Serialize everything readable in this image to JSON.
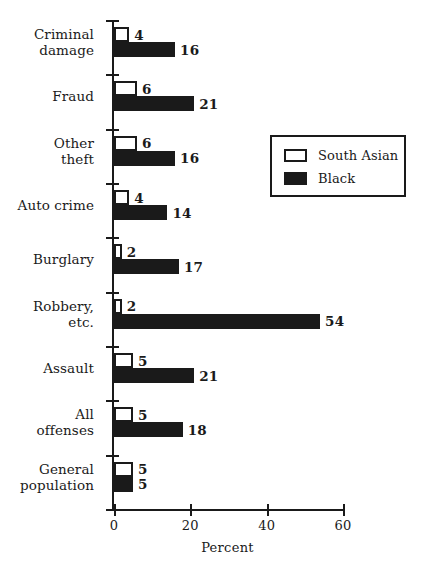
{
  "chart_data": {
    "type": "bar",
    "orientation": "horizontal",
    "title": "",
    "xlabel": "Percent",
    "ylabel": "",
    "xlim": [
      0,
      60
    ],
    "xticks": [
      0,
      20,
      40,
      60
    ],
    "xtick_labels": [
      "0",
      "20",
      "40",
      "60"
    ],
    "grid": false,
    "legend_position": "upper right",
    "categories": [
      "Criminal damage",
      "Fraud",
      "Other theft",
      "Auto crime",
      "Burglary",
      "Robbery, etc.",
      "Assault",
      "All offenses",
      "General population"
    ],
    "category_label_lines": [
      [
        "Criminal",
        "damage"
      ],
      [
        "Fraud"
      ],
      [
        "Other",
        "theft"
      ],
      [
        "Auto crime"
      ],
      [
        "Burglary"
      ],
      [
        "Robbery,",
        "etc."
      ],
      [
        "Assault"
      ],
      [
        "All",
        "offenses"
      ],
      [
        "General",
        "population"
      ]
    ],
    "series": [
      {
        "name": "South Asian",
        "style": "white-outlined",
        "color": "#ffffff",
        "edge_color": "#1a1a1a",
        "values": [
          4,
          6,
          6,
          4,
          2,
          2,
          5,
          5,
          5
        ],
        "value_labels": [
          "4",
          "6",
          "6",
          "4",
          "2",
          "2",
          "5",
          "5",
          "5"
        ]
      },
      {
        "name": "Black",
        "style": "solid-filled",
        "color": "#1a1a1a",
        "edge_color": "#1a1a1a",
        "values": [
          16,
          21,
          16,
          14,
          17,
          54,
          21,
          18,
          5
        ],
        "value_labels": [
          "16",
          "21",
          "16",
          "14",
          "17",
          "54",
          "21",
          "18",
          "5"
        ]
      }
    ]
  },
  "legend": {
    "entries": [
      {
        "label": "South Asian",
        "swatch": "white-outlined"
      },
      {
        "label": "Black",
        "swatch": "solid-filled"
      }
    ]
  },
  "axis": {
    "x_title": "Percent"
  }
}
